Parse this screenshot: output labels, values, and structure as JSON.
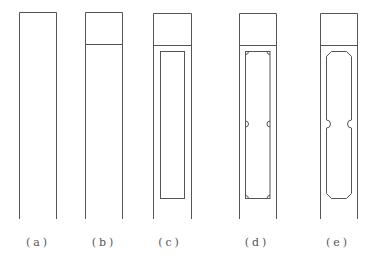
{
  "figure": {
    "panels": [
      {
        "id": "a",
        "label": "(a)",
        "x": 19,
        "width": 38,
        "has_cap": false,
        "inner": "none"
      },
      {
        "id": "b",
        "label": "(b)",
        "x": 85,
        "width": 38,
        "has_cap": true,
        "inner": "none"
      },
      {
        "id": "c",
        "label": "(c)",
        "x": 153,
        "width": 38,
        "has_cap": true,
        "inner": "rectangle"
      },
      {
        "id": "d",
        "label": "(d)",
        "x": 239,
        "width": 37,
        "has_cap": true,
        "inner": "rectangle-with-corner-and-mid-notches"
      },
      {
        "id": "e",
        "label": "(e)",
        "x": 320,
        "width": 37,
        "has_cap": true,
        "inner": "chamfered-with-mid-notches"
      }
    ],
    "line_color": "#555555",
    "background": "#ffffff"
  }
}
